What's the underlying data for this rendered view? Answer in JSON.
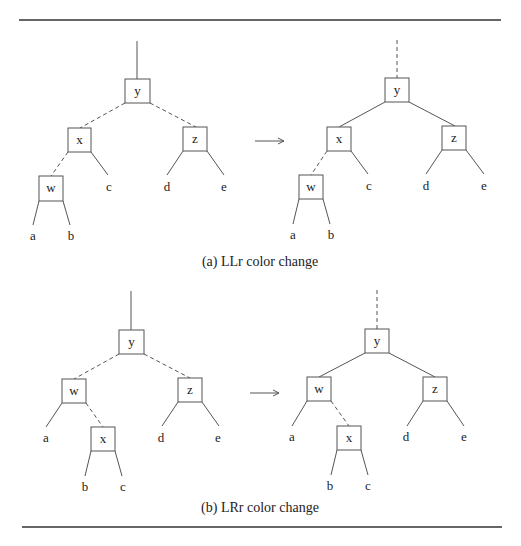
{
  "figure": {
    "panels": [
      {
        "id": "a",
        "caption": "(a) LLr color change",
        "before": {
          "nodes": {
            "y": "y",
            "x": "x",
            "z": "z",
            "w": "w"
          },
          "leaves": {
            "a": "a",
            "b": "b",
            "c": "c",
            "d": "d",
            "e": "e"
          },
          "root_edge": "solid",
          "edges": {
            "y-x": "dashed",
            "y-z": "dashed",
            "x-w": "dashed"
          }
        },
        "after": {
          "nodes": {
            "y": "y",
            "x": "x",
            "z": "z",
            "w": "w"
          },
          "leaves": {
            "a": "a",
            "b": "b",
            "c": "c",
            "d": "d",
            "e": "e"
          },
          "root_edge": "dashed",
          "edges": {
            "y-x": "solid",
            "y-z": "solid",
            "x-w": "dashed"
          }
        }
      },
      {
        "id": "b",
        "caption": "(b) LRr color change",
        "before": {
          "nodes": {
            "y": "y",
            "w": "w",
            "z": "z",
            "x": "x"
          },
          "leaves": {
            "a": "a",
            "b": "b",
            "c": "c",
            "d": "d",
            "e": "e"
          },
          "root_edge": "solid",
          "edges": {
            "y-w": "dashed",
            "y-z": "dashed",
            "w-x": "dashed"
          }
        },
        "after": {
          "nodes": {
            "y": "y",
            "w": "w",
            "z": "z",
            "x": "x"
          },
          "leaves": {
            "a": "a",
            "b": "b",
            "c": "c",
            "d": "d",
            "e": "e"
          },
          "root_edge": "dashed",
          "edges": {
            "y-w": "solid",
            "y-z": "solid",
            "w-x": "dashed"
          }
        }
      }
    ]
  }
}
